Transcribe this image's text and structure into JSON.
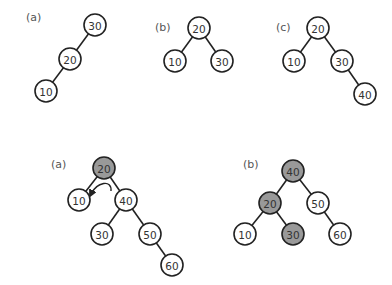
{
  "colors": {
    "node_fill": "#ffffff",
    "highlight_fill": "#999999",
    "stroke": "#222222",
    "text": "#333333",
    "label": "#555555"
  },
  "node_radius": 11,
  "trees": [
    {
      "id": "top-a",
      "label": "(a)",
      "label_pos": [
        26,
        21
      ],
      "nodes": [
        {
          "value": "30",
          "x": 95,
          "y": 25,
          "highlighted": false
        },
        {
          "value": "20",
          "x": 70,
          "y": 59,
          "highlighted": false
        },
        {
          "value": "10",
          "x": 46,
          "y": 91,
          "highlighted": false
        }
      ],
      "edges": [
        [
          0,
          1
        ],
        [
          1,
          2
        ]
      ]
    },
    {
      "id": "top-b",
      "label": "(b)",
      "label_pos": [
        155,
        31
      ],
      "nodes": [
        {
          "value": "20",
          "x": 199,
          "y": 28,
          "highlighted": false
        },
        {
          "value": "10",
          "x": 175,
          "y": 61,
          "highlighted": false
        },
        {
          "value": "30",
          "x": 222,
          "y": 61,
          "highlighted": false
        }
      ],
      "edges": [
        [
          0,
          1
        ],
        [
          0,
          2
        ]
      ]
    },
    {
      "id": "top-c",
      "label": "(c)",
      "label_pos": [
        276,
        31
      ],
      "nodes": [
        {
          "value": "20",
          "x": 318,
          "y": 28,
          "highlighted": false
        },
        {
          "value": "10",
          "x": 294,
          "y": 61,
          "highlighted": false
        },
        {
          "value": "30",
          "x": 342,
          "y": 61,
          "highlighted": false
        },
        {
          "value": "40",
          "x": 365,
          "y": 94,
          "highlighted": false
        }
      ],
      "edges": [
        [
          0,
          1
        ],
        [
          0,
          2
        ],
        [
          2,
          3
        ]
      ]
    },
    {
      "id": "bottom-a",
      "label": "(a)",
      "label_pos": [
        51,
        168
      ],
      "nodes": [
        {
          "value": "20",
          "x": 104,
          "y": 168,
          "highlighted": true
        },
        {
          "value": "10",
          "x": 79,
          "y": 200,
          "highlighted": false
        },
        {
          "value": "40",
          "x": 126,
          "y": 200,
          "highlighted": false
        },
        {
          "value": "30",
          "x": 102,
          "y": 234,
          "highlighted": false
        },
        {
          "value": "50",
          "x": 150,
          "y": 234,
          "highlighted": false
        },
        {
          "value": "60",
          "x": 172,
          "y": 265,
          "highlighted": false
        }
      ],
      "edges": [
        [
          0,
          1
        ],
        [
          0,
          2
        ],
        [
          2,
          3
        ],
        [
          2,
          4
        ],
        [
          4,
          5
        ]
      ],
      "rotation_arrow": {
        "direction": "counter-clockwise",
        "from": [
          111,
          191
        ],
        "to": [
          91,
          194
        ]
      }
    },
    {
      "id": "bottom-b",
      "label": "(b)",
      "label_pos": [
        243,
        168
      ],
      "nodes": [
        {
          "value": "40",
          "x": 293,
          "y": 171,
          "highlighted": true
        },
        {
          "value": "20",
          "x": 270,
          "y": 203,
          "highlighted": true
        },
        {
          "value": "50",
          "x": 318,
          "y": 203,
          "highlighted": false
        },
        {
          "value": "10",
          "x": 245,
          "y": 234,
          "highlighted": false
        },
        {
          "value": "30",
          "x": 293,
          "y": 234,
          "highlighted": true
        },
        {
          "value": "60",
          "x": 340,
          "y": 234,
          "highlighted": false
        }
      ],
      "edges": [
        [
          0,
          1
        ],
        [
          0,
          2
        ],
        [
          1,
          3
        ],
        [
          1,
          4
        ],
        [
          2,
          5
        ]
      ]
    }
  ]
}
